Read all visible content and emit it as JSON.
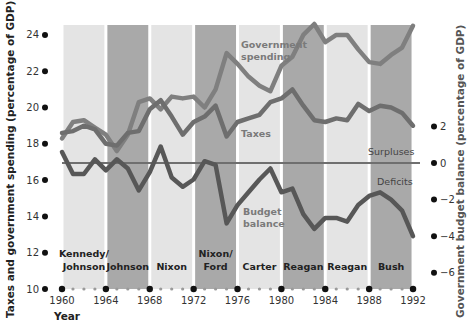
{
  "chart_data": {
    "type": "line",
    "title": "",
    "xlabel": "Year",
    "ylabel": "Taxes and government spending (percentage of GDP)",
    "ylabel_right": "Government budget balance (percentage of GDP)",
    "xlim": [
      1960,
      1992
    ],
    "ylim": [
      10,
      24.8
    ],
    "ylim_right": [
      -6.8,
      7
    ],
    "x_ticks": [
      1960,
      1964,
      1968,
      1972,
      1976,
      1980,
      1984,
      1988,
      1992
    ],
    "y_ticks": [
      10,
      12,
      14,
      16,
      18,
      20,
      22,
      24
    ],
    "y_ticks_right": [
      2,
      0,
      -2,
      -4,
      -6
    ],
    "right_tick_labels": [
      "2",
      "0",
      "−2",
      "−4",
      "−6"
    ],
    "grid": false,
    "zero_line_label_above": "Surpluses",
    "zero_line_label_below": "Deficits",
    "presidential_terms": [
      {
        "label_line1": "Kennedy/",
        "label_line2": "Johnson",
        "start": 1960,
        "end": 1964,
        "shade": "light"
      },
      {
        "label_line1": "Johnson",
        "label_line2": "",
        "start": 1964,
        "end": 1968,
        "shade": "dark"
      },
      {
        "label_line1": "Nixon",
        "label_line2": "",
        "start": 1968,
        "end": 1972,
        "shade": "light"
      },
      {
        "label_line1": "Nixon/",
        "label_line2": "Ford",
        "start": 1972,
        "end": 1976,
        "shade": "dark"
      },
      {
        "label_line1": "Carter",
        "label_line2": "",
        "start": 1976,
        "end": 1980,
        "shade": "light"
      },
      {
        "label_line1": "Reagan",
        "label_line2": "",
        "start": 1980,
        "end": 1984,
        "shade": "dark"
      },
      {
        "label_line1": "Reagan",
        "label_line2": "",
        "start": 1984,
        "end": 1988,
        "shade": "light"
      },
      {
        "label_line1": "Bush",
        "label_line2": "",
        "start": 1988,
        "end": 1992,
        "shade": "dark"
      }
    ],
    "x": [
      1960,
      1961,
      1962,
      1963,
      1964,
      1965,
      1966,
      1967,
      1968,
      1969,
      1970,
      1971,
      1972,
      1973,
      1974,
      1975,
      1976,
      1977,
      1978,
      1979,
      1980,
      1981,
      1982,
      1983,
      1984,
      1985,
      1986,
      1987,
      1988,
      1989,
      1990,
      1991,
      1992
    ],
    "series": [
      {
        "name": "Government spending",
        "axis": "left",
        "label_line1": "Government",
        "label_line2": "spending",
        "values": [
          18.3,
          19.2,
          19.3,
          18.9,
          18.5,
          17.6,
          18.5,
          20.3,
          20.5,
          19.9,
          20.6,
          20.5,
          20.6,
          20.0,
          21.0,
          23.0,
          22.4,
          21.7,
          21.2,
          20.9,
          22.3,
          22.8,
          24.0,
          24.6,
          23.6,
          24.0,
          24.0,
          23.2,
          22.5,
          22.4,
          22.9,
          23.3,
          24.5
        ]
      },
      {
        "name": "Taxes",
        "axis": "left",
        "label_line1": "Taxes",
        "label_line2": "",
        "values": [
          18.6,
          18.7,
          19.0,
          18.8,
          18.0,
          17.9,
          18.6,
          18.7,
          19.9,
          20.4,
          19.5,
          18.5,
          19.2,
          19.5,
          20.1,
          18.4,
          19.2,
          19.4,
          19.6,
          20.3,
          20.5,
          21.0,
          20.1,
          19.3,
          19.2,
          19.4,
          19.3,
          20.2,
          19.8,
          20.1,
          20.0,
          19.7,
          19.0
        ]
      },
      {
        "name": "Budget balance",
        "axis": "right",
        "label_line1": "Budget",
        "label_line2": "balance",
        "values": [
          0.6,
          -0.6,
          -0.6,
          0.2,
          -0.4,
          0.2,
          -0.3,
          -1.5,
          -0.5,
          0.9,
          -0.8,
          -1.3,
          -0.9,
          0.1,
          -0.1,
          -3.3,
          -2.3,
          -1.6,
          -0.9,
          -0.3,
          -1.6,
          -1.4,
          -2.8,
          -3.6,
          -3.0,
          -3.0,
          -3.2,
          -2.3,
          -1.8,
          -1.6,
          -2.0,
          -2.6,
          -4.0
        ]
      }
    ],
    "legend_position": "inline labels"
  },
  "colors": {
    "band_light": "#e4e4e4",
    "band_dark": "#a9a9a9",
    "spending_line": "#7f7f7f",
    "taxes_line": "#6e6e6e",
    "balance_line": "#575757",
    "zero_line": "#6f6f6f",
    "dot_major": "#111111",
    "dot_minor": "#9a9a9a"
  }
}
